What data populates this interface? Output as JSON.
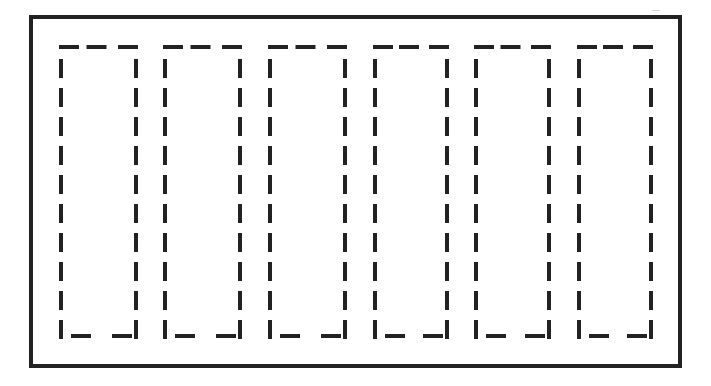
{
  "diagram": {
    "colors": {
      "background": "#ffffff",
      "stroke": "#222222"
    },
    "frame": {
      "x": 31,
      "y": 17,
      "width": 649,
      "height": 349,
      "stroke_width": 4
    },
    "dash_style": {
      "stroke_width": 4,
      "horizontal_dash_length": 20,
      "vertical_dash_length": 19
    },
    "columns": [
      {
        "label": "column-1",
        "left": 61,
        "right": 136,
        "top": 47,
        "bottom": 336
      },
      {
        "label": "column-2",
        "left": 165,
        "right": 240,
        "top": 47,
        "bottom": 336
      },
      {
        "label": "column-3",
        "left": 270,
        "right": 345,
        "top": 47,
        "bottom": 336
      },
      {
        "label": "column-4",
        "left": 375,
        "right": 447,
        "top": 47,
        "bottom": 336
      },
      {
        "label": "column-5",
        "left": 476,
        "right": 549,
        "top": 47,
        "bottom": 336
      },
      {
        "label": "column-6",
        "left": 579,
        "right": 651,
        "top": 47,
        "bottom": 336
      }
    ],
    "vertical_dash_count": 10,
    "top_dash_count": 3,
    "bottom_dash_count": 2
  }
}
